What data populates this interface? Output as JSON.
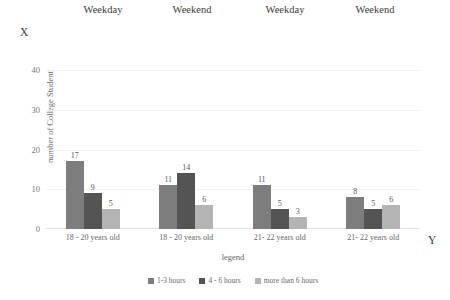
{
  "markers": {
    "x_marker": "X",
    "y_marker": "Y"
  },
  "top_annotations": [
    {
      "label": "Weekday",
      "center_px": 103
    },
    {
      "label": "Weekend",
      "center_px": 192
    },
    {
      "label": "Weekday",
      "center_px": 285
    },
    {
      "label": "Weekend",
      "center_px": 375
    }
  ],
  "chart_data": {
    "type": "bar",
    "title": "",
    "subtitle": "",
    "xlabel": "legend",
    "ylabel": "number of College Student",
    "categories": [
      "18 - 20 years old",
      "18 - 20  years old",
      "21- 22  years old",
      "21- 22  years old"
    ],
    "group_annotations": [
      "Weekday",
      "Weekend",
      "Weekday",
      "Weekend"
    ],
    "series": [
      {
        "name": "1-3 hours",
        "color": "#7d7d7d",
        "values": [
          17,
          11,
          11,
          8
        ]
      },
      {
        "name": "4 - 6 hours",
        "color": "#545454",
        "values": [
          9,
          14,
          5,
          5
        ]
      },
      {
        "name": "more than 6 hours",
        "color": "#b4b4b4",
        "values": [
          5,
          6,
          3,
          6
        ]
      }
    ],
    "ylim": [
      0,
      40
    ],
    "yticks": [
      0,
      10,
      20,
      30,
      40
    ],
    "ytick_labels": [
      "0",
      "10",
      "20",
      "30",
      "40"
    ],
    "grid": true,
    "grid_axis": "y",
    "legend_position": "bottom",
    "bar_labels_shown": true
  },
  "legend": [
    {
      "label": "1-3 hours",
      "color": "#7d7d7d"
    },
    {
      "label": "4 - 6 hours",
      "color": "#545454"
    },
    {
      "label": "more than 6 hours",
      "color": "#b4b4b4"
    }
  ]
}
